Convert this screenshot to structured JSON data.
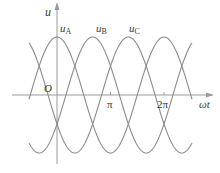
{
  "chart_data": {
    "type": "line",
    "title": "",
    "xlabel": "ωt",
    "ylabel": "u",
    "origin_label": "O",
    "x_ticks": [
      {
        "label": "π",
        "value": 3.14159
      },
      {
        "label": "2π",
        "value": 6.28318
      }
    ],
    "x_range": [
      -1.55,
      7.8
    ],
    "y_range": [
      -1,
      1
    ],
    "grid": false,
    "series": [
      {
        "name": "u_A",
        "label_main": "u",
        "label_sub": "A",
        "phase_peak": 0.0,
        "formula": "cos(ωt)"
      },
      {
        "name": "u_B",
        "label_main": "u",
        "label_sub": "B",
        "phase_peak": 2.0944,
        "formula": "cos(ωt - 2π/3)"
      },
      {
        "name": "u_C",
        "label_main": "u",
        "label_sub": "C",
        "phase_peak": 4.18879,
        "formula": "cos(ωt - 4π/3)"
      }
    ]
  },
  "style": {
    "curve_color": "#8c8c8c",
    "axis_color": "#9a9a9a",
    "text_color": "#3a3a3a"
  },
  "layout": {
    "origin_x": 57,
    "origin_y": 95,
    "px_per_rad": 17.03,
    "amp_px": 58,
    "x_start_px": 29,
    "x_end_px": 192
  }
}
